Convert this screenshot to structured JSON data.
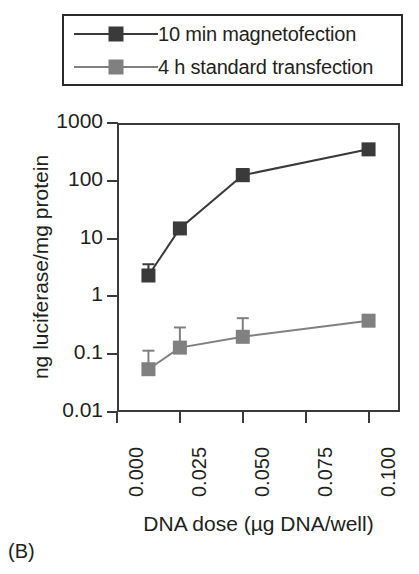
{
  "panel": {
    "label": "(B)"
  },
  "legend": {
    "position": "above-plot",
    "entries": [
      {
        "label": "10 min magnetofection",
        "color": "#3a3a3a",
        "marker": "square",
        "key_icon": "line-square-marker-icon"
      },
      {
        "label": "4 h standard transfection",
        "color": "#808080",
        "marker": "square",
        "key_icon": "line-square-marker-icon"
      }
    ]
  },
  "axes": {
    "y": {
      "title": "ng luciferase/mg protein",
      "scale": "log",
      "ticks": [
        "0.01",
        "0.1",
        "1",
        "10",
        "100",
        "1000"
      ],
      "min": 0.01,
      "max": 1000
    },
    "x": {
      "title": "DNA dose (µg DNA/well)",
      "scale": "linear",
      "ticks": [
        "0.000",
        "0.025",
        "0.050",
        "0.075",
        "0.100"
      ],
      "min": 0.0,
      "max": 0.1125
    }
  },
  "chart_data": {
    "type": "line",
    "title": "",
    "xlabel": "DNA dose (µg DNA/well)",
    "ylabel": "ng luciferase/mg protein",
    "xlim": [
      0.0,
      0.1125
    ],
    "ylim": [
      0.01,
      1000
    ],
    "yscale": "log",
    "xscale": "linear",
    "grid": false,
    "legend_position": "top",
    "x": [
      0.0125,
      0.025,
      0.05,
      0.1
    ],
    "xticks": [
      0.0,
      0.025,
      0.05,
      0.075,
      0.1
    ],
    "xticklabels": [
      "0.000",
      "0.025",
      "0.050",
      "0.075",
      "0.100"
    ],
    "yticks": [
      0.01,
      0.1,
      1,
      10,
      100,
      1000
    ],
    "yticklabels": [
      "0.01",
      "0.1",
      "1",
      "10",
      "100",
      "1000"
    ],
    "series": [
      {
        "name": "10 min magnetofection",
        "color": "#3a3a3a",
        "marker": "square",
        "values": [
          2.3,
          15.0,
          125.0,
          350.0
        ],
        "errors_upper": [
          3.6,
          15.0,
          160.0,
          350.0
        ],
        "errors_lower": [
          2.3,
          15.0,
          125.0,
          350.0
        ]
      },
      {
        "name": "4 h standard transfection",
        "color": "#808080",
        "marker": "square",
        "values": [
          0.055,
          0.13,
          0.2,
          0.38
        ],
        "errors_upper": [
          0.115,
          0.29,
          0.42,
          0.38
        ],
        "errors_lower": [
          0.055,
          0.13,
          0.2,
          0.38
        ]
      }
    ]
  }
}
